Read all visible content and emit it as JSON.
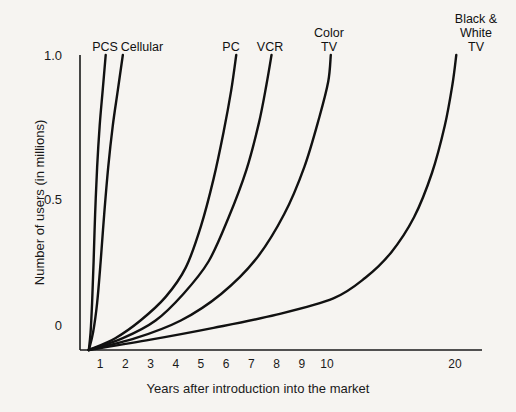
{
  "chart_data": {
    "type": "line",
    "title": "",
    "subtitle": "",
    "xlabel": "Years after introduction into the market",
    "ylabel": "Number of users (in millions)",
    "xticks": [
      1,
      2,
      3,
      4,
      5,
      6,
      7,
      8,
      9,
      10,
      20
    ],
    "xtick_labels": [
      "1",
      "2",
      "3",
      "4",
      "5",
      "6",
      "7",
      "8",
      "9",
      "10",
      "20"
    ],
    "yticks": [
      0,
      0.5,
      1.0
    ],
    "ytick_labels": [
      "0",
      "0.5",
      "1.0"
    ],
    "xlim": [
      0.5,
      22
    ],
    "ylim": [
      0,
      1.0
    ],
    "grid": false,
    "legend": "inline-curve-labels",
    "note": "Technology adoption S-curves; x-axis is compressed after year 10",
    "series": [
      {
        "name": "PCS",
        "label": "PCS",
        "color": "#111111",
        "points": [
          [
            0.55,
            0.0
          ],
          [
            0.62,
            0.06
          ],
          [
            0.68,
            0.16
          ],
          [
            0.74,
            0.3
          ],
          [
            0.8,
            0.46
          ],
          [
            0.88,
            0.62
          ],
          [
            0.98,
            0.76
          ],
          [
            1.1,
            0.88
          ],
          [
            1.22,
            1.0
          ]
        ]
      },
      {
        "name": "Cellular",
        "label": "Cellular",
        "color": "#111111",
        "points": [
          [
            0.55,
            0.0
          ],
          [
            0.72,
            0.06
          ],
          [
            0.88,
            0.16
          ],
          [
            1.02,
            0.3
          ],
          [
            1.16,
            0.46
          ],
          [
            1.32,
            0.62
          ],
          [
            1.5,
            0.76
          ],
          [
            1.7,
            0.88
          ],
          [
            1.9,
            1.0
          ]
        ]
      },
      {
        "name": "PC",
        "label": "PC",
        "color": "#111111",
        "points": [
          [
            0.55,
            0.0
          ],
          [
            1.6,
            0.04
          ],
          [
            2.6,
            0.1
          ],
          [
            3.6,
            0.18
          ],
          [
            4.4,
            0.28
          ],
          [
            5.0,
            0.42
          ],
          [
            5.5,
            0.58
          ],
          [
            5.9,
            0.74
          ],
          [
            6.2,
            0.88
          ],
          [
            6.4,
            1.0
          ]
        ]
      },
      {
        "name": "VCR",
        "label": "VCR",
        "color": "#111111",
        "points": [
          [
            0.55,
            0.0
          ],
          [
            1.9,
            0.04
          ],
          [
            3.2,
            0.1
          ],
          [
            4.3,
            0.19
          ],
          [
            5.3,
            0.3
          ],
          [
            6.1,
            0.45
          ],
          [
            6.8,
            0.61
          ],
          [
            7.3,
            0.77
          ],
          [
            7.6,
            0.9
          ],
          [
            7.8,
            1.0
          ]
        ]
      },
      {
        "name": "Color TV",
        "label": "Color\nTV",
        "color": "#111111",
        "points": [
          [
            0.55,
            0.0
          ],
          [
            2.4,
            0.04
          ],
          [
            4.2,
            0.1
          ],
          [
            5.8,
            0.19
          ],
          [
            7.2,
            0.31
          ],
          [
            8.3,
            0.46
          ],
          [
            9.1,
            0.62
          ],
          [
            9.7,
            0.79
          ],
          [
            10.1,
            0.91
          ],
          [
            10.3,
            1.0
          ]
        ]
      },
      {
        "name": "Black & White TV",
        "label": "Black &\nWhite\nTV",
        "color": "#111111",
        "points": [
          [
            0.55,
            0.0
          ],
          [
            3.0,
            0.035
          ],
          [
            5.5,
            0.075
          ],
          [
            8.0,
            0.12
          ],
          [
            10.5,
            0.175
          ],
          [
            13.0,
            0.245
          ],
          [
            15.0,
            0.33
          ],
          [
            16.8,
            0.45
          ],
          [
            18.2,
            0.6
          ],
          [
            19.2,
            0.76
          ],
          [
            19.8,
            0.9
          ],
          [
            20.1,
            1.0
          ]
        ]
      }
    ]
  },
  "axes": {
    "y_tick_1": "1.0",
    "y_tick_2": "0.5",
    "y_tick_3": "0",
    "x_title": "Years after introduction into the market",
    "y_title": "Number of users (in millions)"
  },
  "x_ticks": [
    {
      "label": "1"
    },
    {
      "label": "2"
    },
    {
      "label": "3"
    },
    {
      "label": "4"
    },
    {
      "label": "5"
    },
    {
      "label": "6"
    },
    {
      "label": "7"
    },
    {
      "label": "8"
    },
    {
      "label": "9"
    },
    {
      "label": "10"
    },
    {
      "label": "20"
    }
  ],
  "curve_labels": [
    {
      "text": "PCS"
    },
    {
      "text": "Cellular"
    },
    {
      "text": "PC"
    },
    {
      "text": "VCR"
    },
    {
      "text": "Color\nTV"
    },
    {
      "text": "Black &\nWhite\nTV"
    }
  ],
  "colors": {
    "background": "#f6f4f1",
    "ink": "#111111",
    "axis": "#1a1a1a"
  }
}
